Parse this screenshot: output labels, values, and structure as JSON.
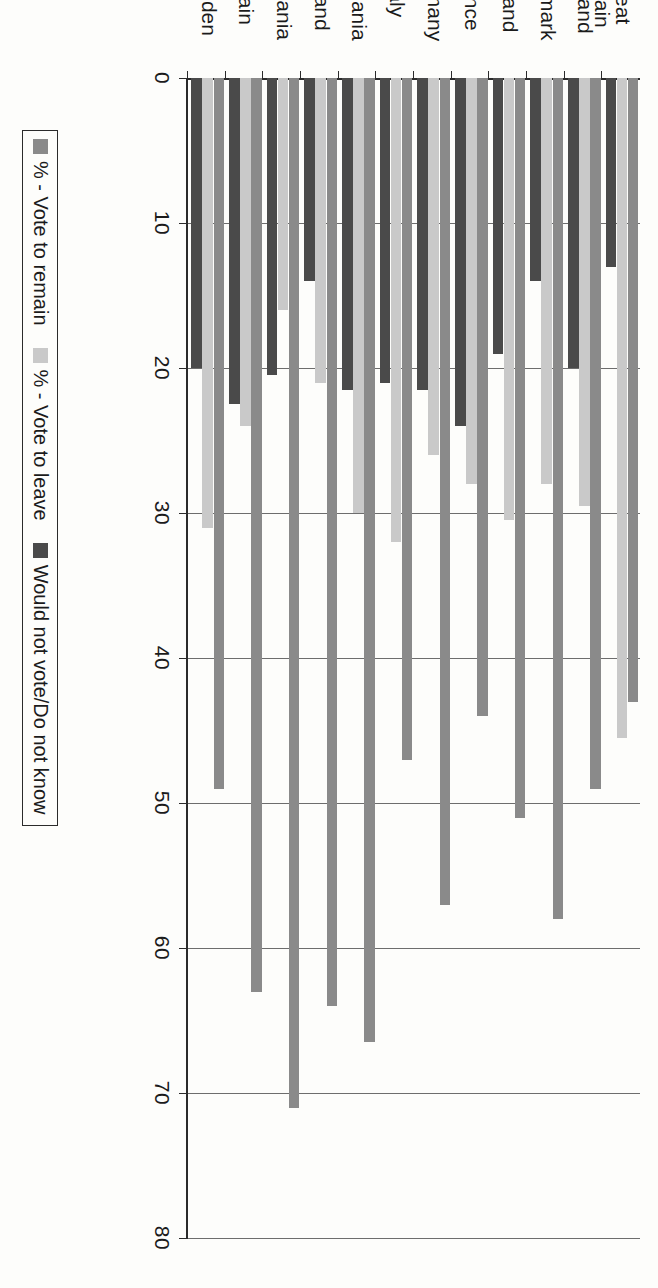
{
  "chart_data": {
    "type": "bar",
    "orientation": "vertical-rotated",
    "title": "",
    "xlabel": "",
    "ylabel": "",
    "ylim": [
      0,
      80
    ],
    "y_ticks": [
      0,
      10,
      20,
      30,
      40,
      50,
      60,
      70,
      80
    ],
    "grid": true,
    "legend_position": "bottom",
    "categories": [
      "Great\nBritain",
      "Holland",
      "Denmark",
      "Finland",
      "France",
      "Germany",
      "Italy",
      "Lithuania",
      "Poland",
      "Romania",
      "Spain",
      "Sweden"
    ],
    "series": [
      {
        "name": "% - Vote to remain",
        "color": "#8a8a8a",
        "values": [
          43,
          49,
          58,
          51,
          44,
          57,
          47,
          66.5,
          64,
          71,
          63,
          49
        ]
      },
      {
        "name": "% - Vote to leave",
        "color": "#c9c9c9",
        "values": [
          45.5,
          29.5,
          28,
          30.5,
          28,
          26,
          32,
          30,
          21,
          16,
          24,
          31
        ]
      },
      {
        "name": "Would not vote/Do not know",
        "color": "#4a4a4a",
        "values": [
          13,
          20,
          14,
          19,
          24,
          21.5,
          21,
          21.5,
          14,
          20.5,
          22.5,
          20
        ]
      }
    ]
  },
  "axis": {
    "tick_labels": [
      "0",
      "10",
      "20",
      "30",
      "40",
      "50",
      "60",
      "70",
      "80"
    ]
  },
  "legend": {
    "items": [
      {
        "label": "% - Vote to remain",
        "swatch": "remain"
      },
      {
        "label": "% - Vote to leave",
        "swatch": "leave"
      },
      {
        "label": "Would not vote/Do not know",
        "swatch": "none"
      }
    ]
  },
  "colors": {
    "remain": "#8a8a8a",
    "leave": "#c9c9c9",
    "none": "#4a4a4a",
    "axis": "#2b2b2b",
    "grid": "#6d6d6d",
    "background": "#fdfdfb"
  }
}
